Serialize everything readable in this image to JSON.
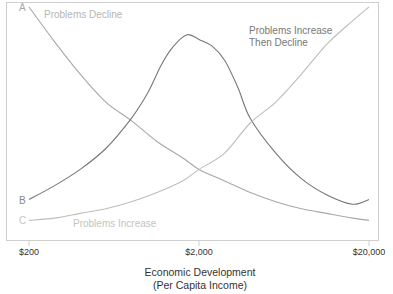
{
  "chart_data": {
    "type": "line",
    "title": "",
    "xlabel": "Economic Development",
    "xlabel_sub": "(Per Capita Income)",
    "ylabel": "",
    "x_scale": "log",
    "xlim": [
      200,
      20000
    ],
    "ylim": [
      0,
      100
    ],
    "grid": false,
    "x_ticks": [
      {
        "value": 200,
        "label": "$200"
      },
      {
        "value": 2000,
        "label": "$2,000"
      },
      {
        "value": 20000,
        "label": "$20,000"
      }
    ],
    "series": [
      {
        "id": "A",
        "name": "Problems Decline",
        "color": "#a8a8a8",
        "letter_color": "#a8a8a8",
        "points": [
          [
            200,
            97
          ],
          [
            283,
            82
          ],
          [
            400,
            68
          ],
          [
            566,
            56
          ],
          [
            800,
            48
          ],
          [
            1131,
            39
          ],
          [
            1600,
            32
          ],
          [
            2000,
            27
          ],
          [
            2828,
            22
          ],
          [
            4000,
            17
          ],
          [
            5657,
            13
          ],
          [
            8000,
            10
          ],
          [
            11314,
            8
          ],
          [
            16000,
            6
          ],
          [
            20000,
            5
          ]
        ]
      },
      {
        "id": "B",
        "name": "Problems Increase Then Decline",
        "color": "#777777",
        "letter_color": "#888888",
        "points": [
          [
            200,
            14
          ],
          [
            283,
            20
          ],
          [
            400,
            27
          ],
          [
            566,
            36
          ],
          [
            800,
            49
          ],
          [
            1000,
            60
          ],
          [
            1200,
            72
          ],
          [
            1414,
            80
          ],
          [
            1700,
            85
          ],
          [
            2000,
            83
          ],
          [
            2400,
            80
          ],
          [
            2828,
            74
          ],
          [
            3400,
            62
          ],
          [
            4000,
            49
          ],
          [
            5657,
            34
          ],
          [
            8000,
            23
          ],
          [
            11314,
            16
          ],
          [
            16000,
            12
          ],
          [
            20000,
            14
          ]
        ]
      },
      {
        "id": "C",
        "name": "Problems Increase",
        "color": "#bdbdbd",
        "letter_color": "#c4c4c4",
        "points": [
          [
            200,
            5
          ],
          [
            283,
            6
          ],
          [
            400,
            8
          ],
          [
            566,
            10
          ],
          [
            800,
            13
          ],
          [
            1131,
            17
          ],
          [
            1600,
            22
          ],
          [
            2000,
            27
          ],
          [
            2828,
            34
          ],
          [
            4000,
            47
          ],
          [
            5657,
            56
          ],
          [
            8000,
            68
          ],
          [
            11314,
            81
          ],
          [
            16000,
            91
          ],
          [
            20000,
            97
          ]
        ]
      }
    ],
    "annotations": [
      {
        "series": "A",
        "text": [
          "Problems Decline"
        ],
        "color": "#b5b5b5"
      },
      {
        "series": "B",
        "text": [
          "Problems Increase",
          "Then Decline"
        ],
        "color": "#777777"
      },
      {
        "series": "C",
        "text": [
          "Problems Increase"
        ],
        "color": "#c4c4c4"
      }
    ]
  }
}
